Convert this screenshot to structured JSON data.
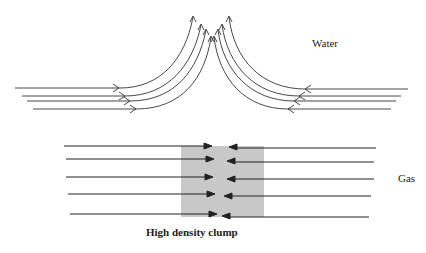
{
  "labels": {
    "water": "Water",
    "gas": "Gas",
    "clump": "High density clump"
  },
  "colors": {
    "line": "#333333",
    "clump_fill": "#c8c8c8",
    "background": "#ffffff"
  },
  "water_panel": {
    "description": "Converging horizontal flow lines that deflect upward at the collision point",
    "left_streams": 4,
    "right_streams": 4
  },
  "gas_panel": {
    "description": "Converging horizontal flow lines that stop and form a high density clump",
    "left_arrows": 5,
    "right_arrows": 5
  }
}
